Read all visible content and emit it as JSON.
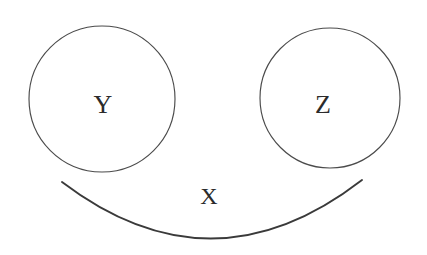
{
  "figure": {
    "type": "venn-like-set-diagram",
    "background_color": "#ffffff",
    "stroke_color": "#4b4b4b",
    "arc_stroke_color": "#3a3a3a",
    "label_color": "#2b2b2b",
    "width": 427,
    "height": 255
  },
  "shapes": {
    "left_circle": {
      "label": "Y",
      "cx": 102,
      "cy": 99,
      "r": 73,
      "label_x": 103,
      "label_y": 104,
      "label_size": 26
    },
    "right_circle": {
      "label": "Z",
      "cx": 330,
      "cy": 98,
      "r": 70,
      "label_x": 323,
      "label_y": 104,
      "label_size": 26
    },
    "bottom_arc": {
      "label": "X",
      "start_x": 62,
      "start_y": 182,
      "end_x": 362,
      "end_y": 180,
      "lowest_x": 210,
      "lowest_y": 245,
      "path": "M 62 182 Q 212 296 362 180",
      "label_x": 209,
      "label_y": 196,
      "label_size": 24
    }
  }
}
